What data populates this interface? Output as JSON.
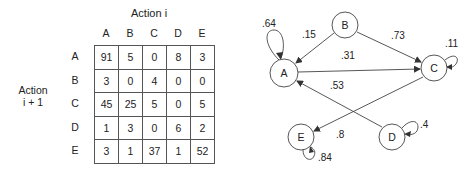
{
  "table": {
    "column_title": "Action i",
    "row_title_line1": "Action",
    "row_title_line2": "i + 1",
    "columns": [
      "A",
      "B",
      "C",
      "D",
      "E"
    ],
    "rows": [
      {
        "label": "A",
        "cells": [
          "91",
          "5",
          "0",
          "8",
          "3"
        ]
      },
      {
        "label": "B",
        "cells": [
          "3",
          "0",
          "4",
          "0",
          "0"
        ]
      },
      {
        "label": "C",
        "cells": [
          "45",
          "25",
          "5",
          "0",
          "5"
        ]
      },
      {
        "label": "D",
        "cells": [
          "1",
          "3",
          "0",
          "6",
          "2"
        ]
      },
      {
        "label": "E",
        "cells": [
          "3",
          "1",
          "37",
          "1",
          "52"
        ]
      }
    ]
  },
  "graph": {
    "nodes": [
      {
        "id": "A",
        "label": "A"
      },
      {
        "id": "B",
        "label": "B"
      },
      {
        "id": "C",
        "label": "C"
      },
      {
        "id": "D",
        "label": "D"
      },
      {
        "id": "E",
        "label": "E"
      }
    ],
    "edges": [
      {
        "from": "A",
        "to": "A",
        "label": ".64"
      },
      {
        "from": "B",
        "to": "A",
        "label": ".15"
      },
      {
        "from": "B",
        "to": "C",
        "label": ".73"
      },
      {
        "from": "A",
        "to": "C",
        "label": ".31"
      },
      {
        "from": "C",
        "to": "C",
        "label": ".11"
      },
      {
        "from": "D",
        "to": "A",
        "label": ".53"
      },
      {
        "from": "C",
        "to": "E",
        "label": ".8"
      },
      {
        "from": "D",
        "to": "D",
        "label": ".4"
      },
      {
        "from": "E",
        "to": "E",
        "label": ".84"
      }
    ]
  }
}
